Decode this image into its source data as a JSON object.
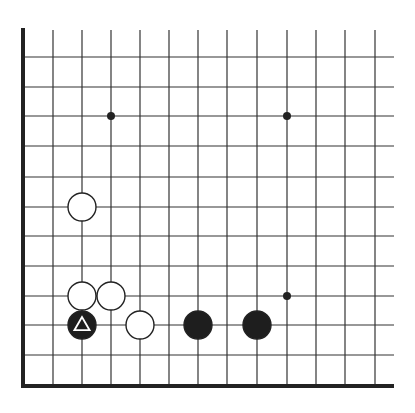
{
  "diagram": {
    "board_colors": {
      "background": "#ffffff",
      "line": "#333333",
      "edge": "#222222",
      "black_stone": "#1e1e1e",
      "white_stone": "#ffffff",
      "stone_outline": "#222222",
      "marker_on_black": "#ffffff"
    },
    "grid": {
      "columns_x": [
        23,
        53,
        82,
        111,
        140,
        169,
        198,
        227,
        257,
        287,
        316,
        345,
        375
      ],
      "rows_y": [
        57,
        87,
        116,
        146,
        177,
        207,
        236,
        266,
        296,
        325,
        355,
        386
      ],
      "top_open_y": 30,
      "right_open_x": 394,
      "left_edge": true,
      "bottom_edge": true
    },
    "star_points": [
      {
        "col": 3,
        "row": 2
      },
      {
        "col": 9,
        "row": 2
      },
      {
        "col": 9,
        "row": 8
      }
    ],
    "stones": [
      {
        "color": "white",
        "col": 2,
        "row": 5
      },
      {
        "color": "white",
        "col": 2,
        "row": 8
      },
      {
        "color": "white",
        "col": 3,
        "row": 8
      },
      {
        "color": "white",
        "col": 4,
        "row": 9
      },
      {
        "color": "black",
        "col": 2,
        "row": 9,
        "marker": "triangle"
      },
      {
        "color": "black",
        "col": 6,
        "row": 9
      },
      {
        "color": "black",
        "col": 8,
        "row": 9
      }
    ]
  }
}
